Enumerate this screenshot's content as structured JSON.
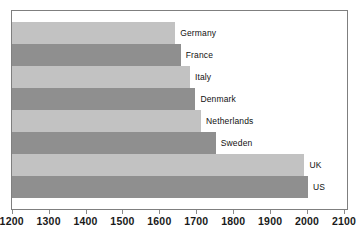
{
  "chart_data": {
    "type": "bar",
    "orientation": "horizontal",
    "title": "",
    "subtitle": "",
    "xlabel": "",
    "ylabel": "",
    "categories": [
      "Germany",
      "France",
      "Italy",
      "Denmark",
      "Netherlands",
      "Sweden",
      "UK",
      "US"
    ],
    "values": [
      1640,
      1655,
      1680,
      1695,
      1710,
      1750,
      1990,
      2000
    ],
    "xlim": [
      1200,
      2100
    ],
    "xticks": [
      1200,
      1300,
      1400,
      1500,
      1600,
      1700,
      1800,
      1900,
      2000,
      2100
    ],
    "xtick_labels": [
      "1200",
      "1300",
      "1400",
      "1500",
      "1600",
      "1700",
      "1800",
      "1900",
      "2000",
      "2100"
    ],
    "grid": false,
    "legend": false,
    "bar_colors": [
      "#c2c2c2",
      "#8f8f8f",
      "#c2c2c2",
      "#8f8f8f",
      "#c2c2c2",
      "#8f8f8f",
      "#c2c2c2",
      "#8f8f8f"
    ],
    "series": [
      {
        "name": "value",
        "points": [
          {
            "label": "Germany",
            "value": 1640,
            "color": "#c2c2c2"
          },
          {
            "label": "France",
            "value": 1655,
            "color": "#8f8f8f"
          },
          {
            "label": "Italy",
            "value": 1680,
            "color": "#c2c2c2"
          },
          {
            "label": "Denmark",
            "value": 1695,
            "color": "#8f8f8f"
          },
          {
            "label": "Netherlands",
            "value": 1710,
            "color": "#c2c2c2"
          },
          {
            "label": "Sweden",
            "value": 1750,
            "color": "#8f8f8f"
          },
          {
            "label": "UK",
            "value": 1990,
            "color": "#c2c2c2"
          },
          {
            "label": "US",
            "value": 2000,
            "color": "#8f8f8f"
          }
        ]
      }
    ],
    "colors": {
      "light_bar": "#c2c2c2",
      "dark_bar": "#8f8f8f",
      "frame": "#7f7f7f",
      "axis_text": "#1a1a1a",
      "label_text": "#111111",
      "background": "#ffffff"
    }
  }
}
